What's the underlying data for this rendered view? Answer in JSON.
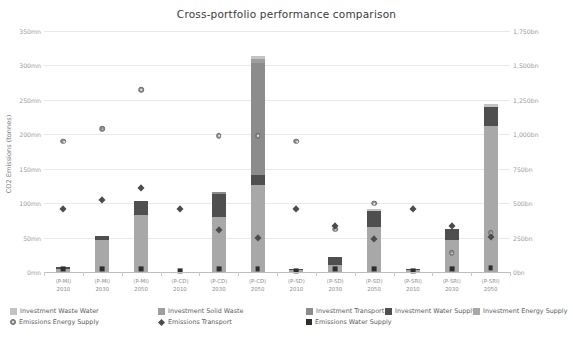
{
  "chart_data": {
    "type": "bar",
    "title": "Cross-portfolio performance comparison",
    "subtitle": "",
    "xlabel": "",
    "ylabel": "CO2 Emissions (tonnes)",
    "y2label": "Cumulative Investment (£)",
    "ylim": [
      0,
      350
    ],
    "y2lim": [
      0,
      1750
    ],
    "grid": true,
    "legend_position": "bottom",
    "stacked": true,
    "y_ticks": [
      "0mn",
      "50mn",
      "100mn",
      "150mn",
      "200mn",
      "250mn",
      "300mn",
      "350mn"
    ],
    "y_tick_values": [
      0,
      50,
      100,
      150,
      200,
      250,
      300,
      350
    ],
    "y2_ticks": [
      "0bn",
      "250bn",
      "500bn",
      "750bn",
      "1,000bn",
      "1,250bn",
      "1,500bn",
      "1,750bn"
    ],
    "y2_tick_values": [
      0,
      250,
      500,
      750,
      1000,
      1250,
      1500,
      1750
    ],
    "categories": [
      {
        "portfolio": "(P-MI)",
        "year": "2010"
      },
      {
        "portfolio": "(P-MI)",
        "year": "2030"
      },
      {
        "portfolio": "(P-MI)",
        "year": "2050"
      },
      {
        "portfolio": "(P-CD)",
        "year": "2010"
      },
      {
        "portfolio": "(P-CD)",
        "year": "2030"
      },
      {
        "portfolio": "(P-CD)",
        "year": "2050"
      },
      {
        "portfolio": "(P-SD)",
        "year": "2010"
      },
      {
        "portfolio": "(P-SD)",
        "year": "2030"
      },
      {
        "portfolio": "(P-SD)",
        "year": "2050"
      },
      {
        "portfolio": "(P-SRI)",
        "year": "2010"
      },
      {
        "portfolio": "(P-SRI)",
        "year": "2030"
      },
      {
        "portfolio": "(P-SRI)",
        "year": "2050"
      }
    ],
    "investment_series": [
      {
        "name": "Investment Energy Supply",
        "color": "#a8a8a8",
        "axis": "y2",
        "values": [
          22,
          230,
          415,
          0,
          400,
          630,
          14,
          48,
          330,
          12,
          230,
          1060
        ]
      },
      {
        "name": "Investment Water Supply",
        "color": "#4f4f4f",
        "axis": "y2",
        "values": [
          18,
          35,
          100,
          0,
          170,
          75,
          10,
          62,
          110,
          10,
          80,
          140
        ]
      },
      {
        "name": "Investment Transport",
        "color": "#8c8c8c",
        "axis": "y2",
        "values": [
          0,
          0,
          0,
          0,
          10,
          815,
          0,
          0,
          0,
          0,
          0,
          0
        ]
      },
      {
        "name": "Investment Solid Waste",
        "color": "#9e9e9e",
        "axis": "y2",
        "values": [
          0,
          0,
          0,
          0,
          0,
          25,
          0,
          0,
          0,
          0,
          0,
          0
        ]
      },
      {
        "name": "Investment Waste Water",
        "color": "#c3c3c3",
        "axis": "y2",
        "values": [
          0,
          0,
          0,
          0,
          0,
          25,
          0,
          0,
          20,
          0,
          0,
          20
        ]
      }
    ],
    "emissions_series": [
      {
        "name": "Emissions Energy Supply",
        "marker": "circle-dot",
        "axis": "y",
        "values": [
          190,
          208,
          265,
          null,
          198,
          198,
          190,
          62,
          100,
          null,
          28,
          57
        ]
      },
      {
        "name": "Emissions Transport",
        "marker": "diamond",
        "axis": "y",
        "values": [
          92,
          105,
          123,
          92,
          62,
          50,
          92,
          68,
          48,
          92,
          67,
          52
        ]
      },
      {
        "name": "Emissions Water Supply",
        "marker": "square",
        "axis": "y",
        "values": [
          5,
          5,
          5,
          2,
          5,
          5,
          2,
          5,
          5,
          2,
          5,
          6
        ]
      }
    ]
  },
  "legend": {
    "row1": [
      {
        "label": "Investment Waste Water",
        "color": "#c3c3c3",
        "kind": "swatch"
      },
      {
        "label": "Investment Solid Waste",
        "color": "#9e9e9e",
        "kind": "swatch"
      },
      {
        "label": "Investment Transport",
        "color": "#8c8c8c",
        "kind": "swatch"
      },
      {
        "label": "Investment Water Supply",
        "color": "#4f4f4f",
        "kind": "swatch"
      },
      {
        "label": "Investment Energy Supply",
        "color": "#a8a8a8",
        "kind": "swatch"
      }
    ],
    "row2": [
      {
        "label": "Emissions Energy Supply",
        "marker": "circle-dot"
      },
      {
        "label": "Emissions Transport",
        "marker": "diamond"
      },
      {
        "label": "Emissions Water Supply",
        "marker": "square"
      }
    ]
  },
  "colors": {
    "grid": "#e9e9e9",
    "axis": "#bdbdbd",
    "tick_text": "#9b9b9b",
    "title_text": "#3a3a3a",
    "background": "#ffffff"
  }
}
